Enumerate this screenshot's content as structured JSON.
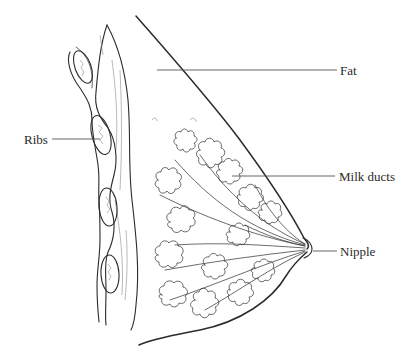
{
  "diagram": {
    "labels": [
      {
        "id": "fat",
        "text": "Fat",
        "x": 340,
        "y": 64
      },
      {
        "id": "ribs",
        "text": "Ribs",
        "x": 24,
        "y": 133
      },
      {
        "id": "milk_ducts",
        "text": "Milk ducts",
        "x": 339,
        "y": 170
      },
      {
        "id": "nipple",
        "text": "Nipple",
        "x": 340,
        "y": 245
      }
    ]
  }
}
